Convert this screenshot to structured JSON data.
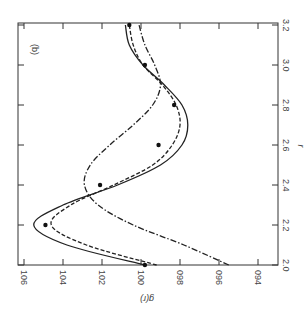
{
  "chart_data": {
    "type": "line",
    "orientation": "rotated-90-clockwise",
    "panel_label": "(b)",
    "xlabel": "r",
    "ylabel": "g(r)",
    "xlim": [
      2.0,
      3.2
    ],
    "ylim": [
      0.94,
      1.06
    ],
    "x_ticks": [
      "2.0",
      "2.2",
      "2.4",
      "2.6",
      "2.8",
      "3.0",
      "3.2"
    ],
    "y_ticks": [
      "1.06",
      "1.04",
      "1.02",
      "1.00",
      "0.98",
      "0.96",
      "0.94"
    ],
    "grid": false,
    "series": [
      {
        "name": "solid",
        "style": "solid",
        "x": [
          2.0,
          2.1,
          2.2,
          2.3,
          2.4,
          2.5,
          2.6,
          2.7,
          2.8,
          2.9,
          3.0,
          3.1,
          3.2
        ],
        "y": [
          0.998,
          1.038,
          1.055,
          1.04,
          1.012,
          0.99,
          0.979,
          0.976,
          0.979,
          0.988,
          0.999,
          1.006,
          1.008
        ]
      },
      {
        "name": "dashed",
        "style": "dashed",
        "x": [
          2.0,
          2.1,
          2.2,
          2.3,
          2.4,
          2.5,
          2.6,
          2.7,
          2.8,
          2.9,
          3.0,
          3.1,
          3.2
        ],
        "y": [
          0.992,
          1.028,
          1.046,
          1.036,
          1.014,
          0.994,
          0.984,
          0.98,
          0.982,
          0.989,
          0.999,
          1.004,
          1.006
        ]
      },
      {
        "name": "dash-dot",
        "style": "dash-dot",
        "x": [
          2.0,
          2.1,
          2.2,
          2.3,
          2.4,
          2.5,
          2.6,
          2.7,
          2.8,
          2.9,
          3.0,
          3.1,
          3.2
        ],
        "y": [
          0.955,
          0.978,
          1.004,
          1.022,
          1.029,
          1.026,
          1.016,
          1.004,
          0.994,
          0.99,
          0.993,
          0.998,
          1.001
        ]
      },
      {
        "name": "data points",
        "style": "markers",
        "x": [
          2.0,
          2.2,
          2.4,
          2.6,
          2.8,
          3.0,
          3.2
        ],
        "y": [
          0.998,
          1.049,
          1.021,
          0.991,
          0.983,
          0.998,
          1.006
        ]
      }
    ]
  }
}
